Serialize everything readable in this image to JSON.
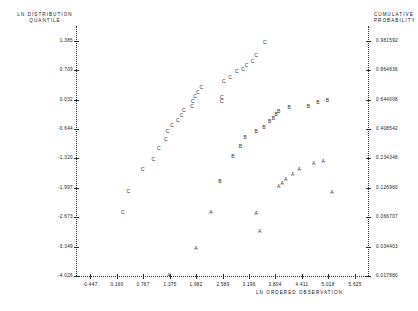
{
  "chart_data": {
    "type": "scatter",
    "title": "",
    "ylabel": "LN DISTRIBUTION QUANTILE",
    "xlabel": "LN ORDERED OBSERVATION",
    "y2label": "CUMULATIVE PROBABILITY",
    "xlim": [
      -0.7505,
      5.9285
    ],
    "ylim": [
      -4.026,
      1.723
    ],
    "grid": false,
    "legend": "none",
    "xticks": [
      -0.447,
      0.16,
      0.767,
      1.375,
      1.982,
      2.589,
      3.196,
      3.804,
      4.411,
      5.018,
      5.625
    ],
    "xtick_labels": [
      "-0.447",
      "0.160",
      "0.767",
      "1.375",
      "1.982",
      "2.589",
      "3.196",
      "3.804",
      "4.411",
      "5.018",
      "5.625"
    ],
    "yticks": [
      1.385,
      0.709,
      0.032,
      -0.644,
      -1.32,
      -1.997,
      -2.673,
      -3.349,
      -4.026
    ],
    "ytick_labels": [
      "1.385",
      "0.709",
      "0.032",
      "-0.644",
      "-1.320",
      "-1.997",
      "-2.673",
      "-3.349",
      "-4.026"
    ],
    "y2ticks": [
      1.385,
      0.709,
      0.032,
      -0.644,
      -1.32,
      -1.997,
      -2.673,
      -3.349,
      -4.026
    ],
    "y2tick_labels": [
      "0.981592",
      "0.864836",
      "0.644008",
      "0.408542",
      "0.234348",
      "0.126960",
      "0.066707",
      "0.034403",
      "0.017880"
    ],
    "series": [
      {
        "name": "C",
        "marker": "C",
        "points": [
          [
            0.3,
            -2.56
          ],
          [
            0.43,
            -2.08
          ],
          [
            0.76,
            -1.56
          ],
          [
            1.0,
            -1.33
          ],
          [
            1.13,
            -1.09
          ],
          [
            1.29,
            -0.87
          ],
          [
            1.33,
            -0.69
          ],
          [
            1.43,
            -0.56
          ],
          [
            1.56,
            -0.43
          ],
          [
            1.65,
            -0.33
          ],
          [
            1.7,
            -0.215
          ],
          [
            1.89,
            -0.11
          ],
          [
            1.91,
            0.01
          ],
          [
            1.96,
            0.11
          ],
          [
            2.02,
            0.215
          ],
          [
            2.1,
            0.33
          ],
          [
            2.57,
            0.095
          ],
          [
            2.57,
            0.01
          ],
          [
            2.62,
            0.455
          ],
          [
            2.76,
            0.56
          ],
          [
            2.92,
            0.69
          ],
          [
            3.06,
            0.74
          ],
          [
            3.14,
            0.83
          ],
          [
            3.28,
            0.93
          ],
          [
            3.36,
            1.06
          ],
          [
            3.56,
            1.345
          ]
        ]
      },
      {
        "name": "B",
        "marker": "B",
        "points": [
          [
            2.53,
            -1.83
          ],
          [
            2.83,
            -1.27
          ],
          [
            3.0,
            -1.04
          ],
          [
            3.11,
            -0.83
          ],
          [
            3.36,
            -0.69
          ],
          [
            3.54,
            -0.6
          ],
          [
            3.67,
            -0.47
          ],
          [
            3.76,
            -0.39
          ],
          [
            3.82,
            -0.31
          ],
          [
            3.88,
            -0.23
          ],
          [
            4.12,
            -0.13
          ],
          [
            4.56,
            -0.115
          ],
          [
            4.78,
            -0.015
          ],
          [
            5.0,
            0.03
          ]
        ]
      },
      {
        "name": "A",
        "marker": "A",
        "points": [
          [
            1.36,
            -4.01
          ],
          [
            1.98,
            -3.37
          ],
          [
            2.32,
            -2.56
          ],
          [
            3.36,
            -2.58
          ],
          [
            3.44,
            -2.99
          ],
          [
            3.88,
            -1.96
          ],
          [
            3.96,
            -1.89
          ],
          [
            4.04,
            -1.8
          ],
          [
            4.2,
            -1.69
          ],
          [
            4.35,
            -1.56
          ],
          [
            4.68,
            -1.43
          ],
          [
            4.9,
            -1.37
          ],
          [
            5.1,
            -2.09
          ]
        ]
      }
    ]
  }
}
